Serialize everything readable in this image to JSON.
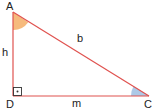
{
  "diagram": {
    "type": "right-triangle",
    "vertices": [
      {
        "id": "A",
        "label": "A",
        "x": 13,
        "y": 12
      },
      {
        "id": "D",
        "label": "D",
        "x": 13,
        "y": 96
      },
      {
        "id": "C",
        "label": "C",
        "x": 149,
        "y": 96
      }
    ],
    "sides": [
      {
        "id": "h",
        "label": "h",
        "from": "A",
        "to": "D"
      },
      {
        "id": "m",
        "label": "m",
        "from": "D",
        "to": "C"
      },
      {
        "id": "b",
        "label": "b",
        "from": "A",
        "to": "C"
      }
    ],
    "right_angle_at": "D",
    "angle_marks": [
      {
        "vertex": "A",
        "color": "#f5b36f"
      },
      {
        "vertex": "C",
        "color": "#a9c6e6"
      }
    ],
    "colors": {
      "line": "#e0524f",
      "angle_A": "#f5b36f",
      "angle_C": "#a9c6e6",
      "right_angle_marker": "#333333",
      "text": "#222222"
    }
  },
  "labels": {
    "A": "A",
    "D": "D",
    "C": "C",
    "h": "h",
    "b": "b",
    "m": "m"
  }
}
